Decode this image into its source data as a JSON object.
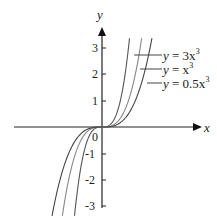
{
  "chart_data": {
    "type": "line",
    "title": "",
    "xlabel": "x",
    "ylabel": "y",
    "ylim": [
      -3,
      3
    ],
    "xlim": [
      -1.6,
      3.8
    ],
    "yticks": [
      "3",
      "2",
      "1",
      "0",
      "-1",
      "-2",
      "-3"
    ],
    "origin_label": "0",
    "grid": false,
    "legend_position": "upper right (leader-line labels)",
    "series": [
      {
        "name": "y = 3x³",
        "label_y": "y",
        "label_eq": "= 3x",
        "label_exp": "3",
        "coef": 3,
        "color": "#555555"
      },
      {
        "name": "y = x³",
        "label_y": "y",
        "label_eq": "= x",
        "label_exp": "3",
        "coef": 1,
        "color": "#888888"
      },
      {
        "name": "y = 0.5x³",
        "label_y": "y",
        "label_eq": "= 0.5x",
        "label_exp": "3",
        "coef": 0.5,
        "color": "#444444"
      }
    ]
  }
}
